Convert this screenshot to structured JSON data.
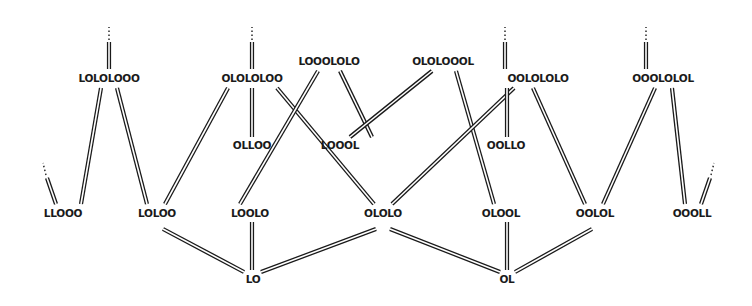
{
  "diagram": {
    "type": "lattice",
    "nodes": [
      {
        "id": "LOLOLOOO",
        "label": "LOLOLOOO",
        "x": 109,
        "y": 78
      },
      {
        "id": "OLOLOLOO",
        "label": "OLOLOLOO",
        "x": 252,
        "y": 78
      },
      {
        "id": "LOOOLOLO",
        "label": "LOOOLOLO",
        "x": 329,
        "y": 61
      },
      {
        "id": "OLOLOOOL",
        "label": "OLOLOOOL",
        "x": 443,
        "y": 61
      },
      {
        "id": "OOLOLOLO",
        "label": "OOLOLOLO",
        "x": 538,
        "y": 78
      },
      {
        "id": "OOOLOLOL",
        "label": "OOOLOLOL",
        "x": 663,
        "y": 78
      },
      {
        "id": "OLLOO",
        "label": "OLLOO",
        "x": 252,
        "y": 145
      },
      {
        "id": "LOOOL",
        "label": "LOOOL",
        "x": 340,
        "y": 145
      },
      {
        "id": "OOLLO",
        "label": "OOLLO",
        "x": 506,
        "y": 145
      },
      {
        "id": "LLOOO",
        "label": "LLOOO",
        "x": 63,
        "y": 213
      },
      {
        "id": "LOLOO",
        "label": "LOLOO",
        "x": 157,
        "y": 213
      },
      {
        "id": "LOOLO",
        "label": "LOOLO",
        "x": 250,
        "y": 213
      },
      {
        "id": "OLOLO",
        "label": "OLOLO",
        "x": 383,
        "y": 213
      },
      {
        "id": "OLOOL",
        "label": "OLOOL",
        "x": 501,
        "y": 213
      },
      {
        "id": "OOLOL",
        "label": "OOLOL",
        "x": 595,
        "y": 213
      },
      {
        "id": "OOOLL",
        "label": "OOOLL",
        "x": 692,
        "y": 213
      },
      {
        "id": "LO",
        "label": "LO",
        "x": 253,
        "y": 279
      },
      {
        "id": "OL",
        "label": "OL",
        "x": 507,
        "y": 279
      }
    ],
    "edges": [
      {
        "from": [
          101,
          88
        ],
        "to": [
          81,
          204
        ]
      },
      {
        "from": [
          117,
          88
        ],
        "to": [
          147,
          204
        ]
      },
      {
        "from": [
          228,
          88
        ],
        "to": [
          165,
          204
        ]
      },
      {
        "from": [
          252,
          88
        ],
        "to": [
          252,
          137
        ]
      },
      {
        "from": [
          277,
          88
        ],
        "to": [
          374,
          204
        ]
      },
      {
        "from": [
          318,
          71
        ],
        "to": [
          240,
          204
        ]
      },
      {
        "from": [
          340,
          71
        ],
        "to": [
          372,
          137
        ]
      },
      {
        "from": [
          432,
          71
        ],
        "to": [
          350,
          137
        ]
      },
      {
        "from": [
          456,
          71
        ],
        "to": [
          494,
          204
        ]
      },
      {
        "from": [
          514,
          88
        ],
        "to": [
          392,
          204
        ]
      },
      {
        "from": [
          507,
          88
        ],
        "to": [
          507,
          137
        ]
      },
      {
        "from": [
          533,
          88
        ],
        "to": [
          585,
          204
        ]
      },
      {
        "from": [
          655,
          88
        ],
        "to": [
          603,
          204
        ]
      },
      {
        "from": [
          672,
          88
        ],
        "to": [
          685,
          204
        ]
      },
      {
        "from": [
          163,
          229
        ],
        "to": [
          244,
          272
        ]
      },
      {
        "from": [
          252,
          222
        ],
        "to": [
          252,
          270
        ]
      },
      {
        "from": [
          376,
          229
        ],
        "to": [
          261,
          272
        ]
      },
      {
        "from": [
          390,
          229
        ],
        "to": [
          500,
          272
        ]
      },
      {
        "from": [
          507,
          222
        ],
        "to": [
          507,
          270
        ]
      },
      {
        "from": [
          592,
          229
        ],
        "to": [
          515,
          272
        ]
      }
    ],
    "open_ends": [
      {
        "node": "LOLOLOOO",
        "line_from": [
          109,
          69
        ],
        "line_to": [
          109,
          42
        ],
        "dots_from": [
          109,
          40
        ],
        "dots_to": [
          109,
          27
        ]
      },
      {
        "node": "OLOLOLOO",
        "line_from": [
          252,
          69
        ],
        "line_to": [
          252,
          42
        ],
        "dots_from": [
          252,
          40
        ],
        "dots_to": [
          252,
          27
        ]
      },
      {
        "node": "OOLOLOLO",
        "line_from": [
          505,
          69
        ],
        "line_to": [
          505,
          42
        ],
        "dots_from": [
          505,
          40
        ],
        "dots_to": [
          505,
          27
        ]
      },
      {
        "node": "OOOLOLOL",
        "line_from": [
          646,
          69
        ],
        "line_to": [
          646,
          42
        ],
        "dots_from": [
          646,
          40
        ],
        "dots_to": [
          646,
          27
        ]
      },
      {
        "node": "LLOOO",
        "line_from": [
          56,
          204
        ],
        "line_to": [
          47,
          178
        ],
        "dots_from": [
          46,
          175
        ],
        "dots_to": [
          43,
          163
        ]
      },
      {
        "node": "OOOLL",
        "line_from": [
          701,
          204
        ],
        "line_to": [
          710,
          178
        ],
        "dots_from": [
          711,
          175
        ],
        "dots_to": [
          714,
          163
        ]
      }
    ]
  }
}
